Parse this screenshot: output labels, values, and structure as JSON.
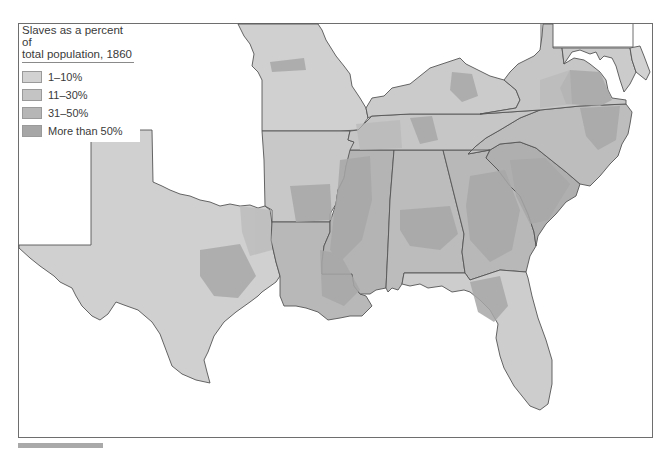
{
  "legend": {
    "title_line1": "Slaves as a percent of",
    "title_line2": "total population, 1860",
    "items": [
      {
        "label": "1–10%",
        "color": "#d2d2d2"
      },
      {
        "label": "11–30%",
        "color": "#c4c4c4"
      },
      {
        "label": "31–50%",
        "color": "#b6b6b6"
      },
      {
        "label": "More than 50%",
        "color": "#a6a6a6"
      }
    ]
  },
  "map": {
    "subject": "Southern United States counties, 1860",
    "states": [
      "Texas",
      "Missouri",
      "Arkansas",
      "Louisiana",
      "Mississippi",
      "Alabama",
      "Georgia",
      "Florida",
      "South Carolina",
      "North Carolina",
      "Tennessee",
      "Kentucky",
      "Virginia",
      "Maryland",
      "Delaware"
    ],
    "colors": {
      "frame": "#6e6e6e",
      "state_border": "#555555",
      "background": "#ffffff"
    }
  }
}
